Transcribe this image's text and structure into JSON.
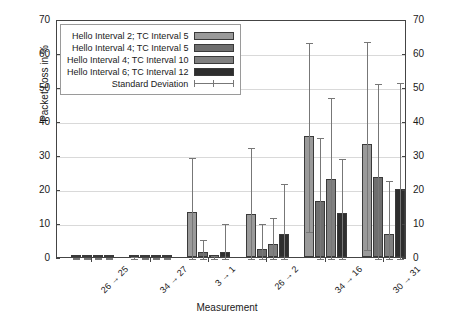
{
  "chart_data": {
    "type": "bar",
    "title": "",
    "xlabel": "Measurement",
    "ylabel": "Packet Loss in %",
    "ylim": [
      0,
      70
    ],
    "ytick_step": 10,
    "yticks": [
      0,
      10,
      20,
      30,
      40,
      50,
      60,
      70
    ],
    "grid": true,
    "legend_position": "top-left-inside",
    "categories": [
      "26 → 25",
      "34 → 27",
      "3 → 1",
      "26 → 2",
      "34 → 16",
      "30 → 31"
    ],
    "series": [
      {
        "name": "Hello Interval 2; TC Interval 5",
        "color": "#9a9a9a",
        "values": [
          0.0,
          0.1,
          13.2,
          12.6,
          35.7,
          33.2
        ],
        "errors": [
          0.2,
          0.5,
          16.5,
          20.0,
          27.8,
          30.5
        ]
      },
      {
        "name": "Hello Interval 4; TC Interval 5",
        "color": "#6e6e6e",
        "values": [
          0.0,
          0.0,
          1.5,
          2.5,
          16.4,
          23.6
        ],
        "errors": [
          0.2,
          0.3,
          4.1,
          7.9,
          19.2,
          27.9
        ]
      },
      {
        "name": "Hello Interval 4; TC Interval 10",
        "color": "#808080",
        "values": [
          0.0,
          0.0,
          0.3,
          3.9,
          22.9,
          6.9
        ],
        "errors": [
          0.2,
          0.3,
          0.5,
          8.1,
          24.5,
          16.0
        ]
      },
      {
        "name": "Hello Interval 6; TC Interval 12",
        "color": "#2e2e2e",
        "values": [
          0.0,
          0.0,
          1.6,
          6.8,
          12.8,
          20.1
        ],
        "errors": [
          0.2,
          0.3,
          8.6,
          15.3,
          16.7,
          31.8
        ]
      }
    ],
    "error_legend_label": "Standard Deviation"
  },
  "axes": {
    "y_left_labels": [
      "0",
      "10",
      "20",
      "30",
      "40",
      "50",
      "60",
      "70"
    ],
    "y_right_labels": [
      "0",
      "10",
      "20",
      "30",
      "40",
      "50",
      "60",
      "70"
    ],
    "y_axis_title": "Packet Loss in %",
    "x_axis_title": "Measurement"
  },
  "legend": {
    "rows": [
      {
        "label": "Hello Interval 2; TC Interval 5",
        "swatch": "#9a9a9a"
      },
      {
        "label": "Hello Interval 4; TC Interval 5",
        "swatch": "#6e6e6e"
      },
      {
        "label": "Hello Interval 4; TC Interval 10",
        "swatch": "#808080"
      },
      {
        "label": "Hello Interval 6; TC Interval 12",
        "swatch": "#2e2e2e"
      },
      {
        "label": "Standard Deviation",
        "swatch": "errorbar"
      }
    ]
  }
}
